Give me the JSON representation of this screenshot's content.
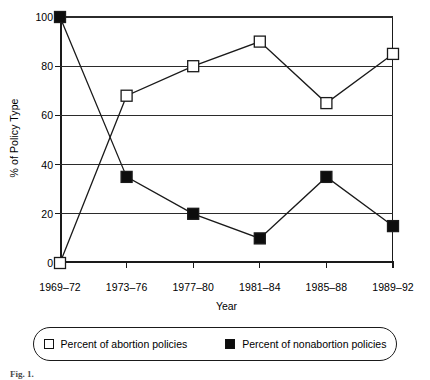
{
  "chart_data": {
    "type": "line",
    "title": "",
    "xlabel": "Year",
    "ylabel": "% of Policy Type",
    "categories": [
      "1969–72",
      "1973–76",
      "1977–80",
      "1981–84",
      "1985–88",
      "1989–92"
    ],
    "series": [
      {
        "name": "Percent of abortion policies",
        "marker": "open-square",
        "values": [
          0,
          68,
          80,
          90,
          65,
          85
        ]
      },
      {
        "name": "Percent of nonabortion policies",
        "marker": "filled-square",
        "values": [
          100,
          35,
          20,
          10,
          35,
          15
        ]
      }
    ],
    "ylim": [
      0,
      100
    ],
    "yticks": [
      0,
      20,
      40,
      60,
      80,
      100
    ],
    "ytick_labels": [
      "0",
      "20",
      "40",
      "60",
      "80",
      "100"
    ],
    "grid": true,
    "grid_axis": "y",
    "legend_position": "bottom",
    "line_color": "#1a1a1a",
    "marker_fill_open": "#ffffff",
    "marker_fill_closed": "#0d0d0d"
  },
  "figure": {
    "caption": "Fig. 1."
  }
}
